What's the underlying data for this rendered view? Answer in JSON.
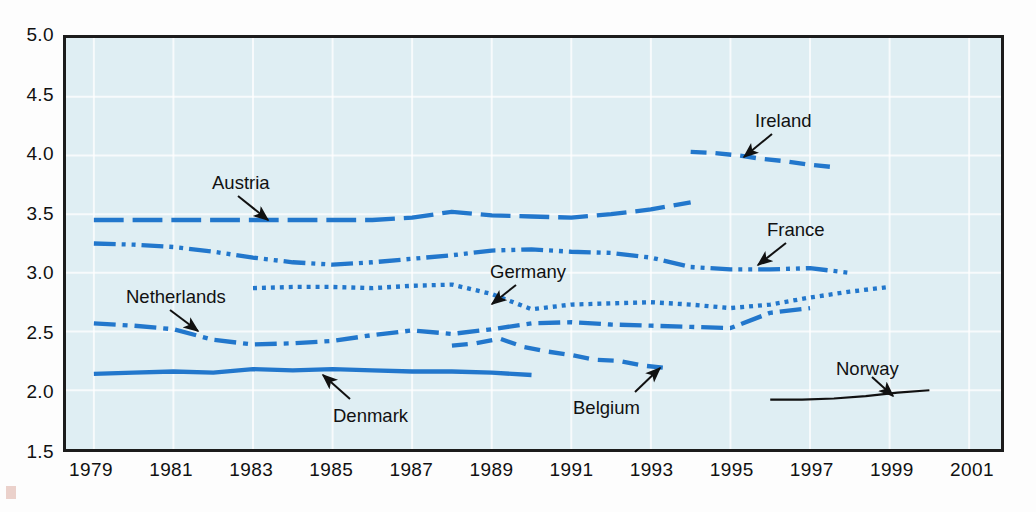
{
  "chart_data": {
    "type": "line",
    "title": "",
    "xlabel": "",
    "ylabel": "",
    "xlim": [
      1978.3,
      2001.8
    ],
    "ylim": [
      1.5,
      5.0
    ],
    "yticks": [
      "1.5",
      "2.0",
      "2.5",
      "3.0",
      "3.5",
      "4.0",
      "4.5",
      "5.0"
    ],
    "xticks": [
      "1979",
      "1981",
      "1983",
      "1985",
      "1987",
      "1989",
      "1991",
      "1993",
      "1995",
      "1997",
      "1999",
      "2001"
    ],
    "grid": true,
    "legend_position": "inline-annotations",
    "plot_bgcolor": "#dfeef3",
    "series_color": "#2277cc",
    "series": [
      {
        "name": "Ireland",
        "dash": "dashed",
        "color": "#2277cc",
        "x": [
          1994,
          1994.6,
          1995.2,
          1995.8,
          1996.4,
          1997,
          1997.6
        ],
        "values": [
          4.03,
          4.02,
          4.0,
          3.97,
          3.95,
          3.92,
          3.9
        ]
      },
      {
        "name": "Austria",
        "dash": "long-dash",
        "color": "#2277cc",
        "x": [
          1979,
          1980,
          1981,
          1982,
          1983,
          1984,
          1985,
          1986,
          1987,
          1988,
          1989,
          1990,
          1991,
          1992,
          1993,
          1994
        ],
        "values": [
          3.45,
          3.45,
          3.45,
          3.45,
          3.45,
          3.45,
          3.45,
          3.45,
          3.47,
          3.52,
          3.49,
          3.48,
          3.47,
          3.5,
          3.54,
          3.6
        ]
      },
      {
        "name": "France",
        "dash": "dash-dot-dot",
        "color": "#2277cc",
        "x": [
          1979,
          1980,
          1981,
          1982,
          1983,
          1984,
          1985,
          1986,
          1987,
          1988,
          1989,
          1990,
          1991,
          1992,
          1993,
          1994,
          1995,
          1996,
          1997,
          1998
        ],
        "values": [
          3.25,
          3.24,
          3.22,
          3.18,
          3.13,
          3.09,
          3.07,
          3.09,
          3.12,
          3.15,
          3.19,
          3.2,
          3.18,
          3.17,
          3.13,
          3.05,
          3.03,
          3.03,
          3.04,
          3.0
        ]
      },
      {
        "name": "Germany",
        "dash": "dotted",
        "color": "#2277cc",
        "x": [
          1983,
          1984,
          1985,
          1986,
          1987,
          1988,
          1989,
          1990,
          1991,
          1992,
          1993,
          1994,
          1995,
          1996,
          1997,
          1998,
          1999
        ],
        "values": [
          2.87,
          2.88,
          2.88,
          2.87,
          2.89,
          2.9,
          2.82,
          2.69,
          2.73,
          2.74,
          2.75,
          2.73,
          2.7,
          2.73,
          2.79,
          2.84,
          2.88
        ]
      },
      {
        "name": "Netherlands",
        "dash": "dash-dot",
        "color": "#2277cc",
        "x": [
          1979,
          1980,
          1981,
          1982,
          1983,
          1984,
          1985,
          1986,
          1987,
          1988,
          1989,
          1990,
          1991,
          1992,
          1993,
          1994,
          1995,
          1996,
          1997
        ],
        "values": [
          2.57,
          2.55,
          2.52,
          2.43,
          2.39,
          2.4,
          2.42,
          2.47,
          2.51,
          2.48,
          2.52,
          2.57,
          2.58,
          2.56,
          2.55,
          2.54,
          2.53,
          2.66,
          2.7
        ]
      },
      {
        "name": "Belgium",
        "dash": "dashed",
        "color": "#2277cc",
        "x": [
          1988,
          1988.6,
          1989.2,
          1989.8,
          1990.4,
          1991,
          1991.6,
          1992.2,
          1992.8,
          1993.4
        ],
        "values": [
          2.38,
          2.4,
          2.44,
          2.37,
          2.33,
          2.3,
          2.26,
          2.25,
          2.21,
          2.19
        ]
      },
      {
        "name": "Denmark",
        "dash": "solid",
        "color": "#2277cc",
        "x": [
          1979,
          1980,
          1981,
          1982,
          1983,
          1984,
          1985,
          1986,
          1987,
          1988,
          1989,
          1990
        ],
        "values": [
          2.14,
          2.15,
          2.16,
          2.15,
          2.18,
          2.17,
          2.18,
          2.17,
          2.16,
          2.16,
          2.15,
          2.13
        ]
      },
      {
        "name": "Norway",
        "dash": "solid",
        "color": "#111111",
        "x": [
          1996,
          1996.8,
          1997.6,
          1998.4,
          1999.2,
          2000
        ],
        "values": [
          1.92,
          1.92,
          1.93,
          1.95,
          1.98,
          2.0
        ]
      }
    ],
    "annotations": [
      {
        "label": "Austria",
        "label_x": 212,
        "label_y": 172,
        "ax": 238,
        "ay": 196,
        "bx": 268,
        "by": 220
      },
      {
        "label": "Ireland",
        "label_x": 755,
        "label_y": 110,
        "ax": 772,
        "ay": 134,
        "bx": 744,
        "by": 157
      },
      {
        "label": "France",
        "label_x": 767,
        "label_y": 219,
        "ax": 786,
        "ay": 243,
        "bx": 758,
        "by": 265
      },
      {
        "label": "Germany",
        "label_x": 490,
        "label_y": 261,
        "ax": 516,
        "ay": 285,
        "bx": 492,
        "by": 304
      },
      {
        "label": "Netherlands",
        "label_x": 126,
        "label_y": 286,
        "ax": 170,
        "ay": 310,
        "bx": 198,
        "by": 331
      },
      {
        "label": "Denmark",
        "label_x": 333,
        "label_y": 405,
        "ax": 350,
        "ay": 399,
        "bx": 323,
        "by": 375
      },
      {
        "label": "Belgium",
        "label_x": 573,
        "label_y": 397,
        "ax": 635,
        "ay": 392,
        "bx": 660,
        "by": 368
      },
      {
        "label": "Norway",
        "label_x": 836,
        "label_y": 358,
        "ax": 872,
        "ay": 377,
        "bx": 893,
        "by": 396
      }
    ]
  }
}
